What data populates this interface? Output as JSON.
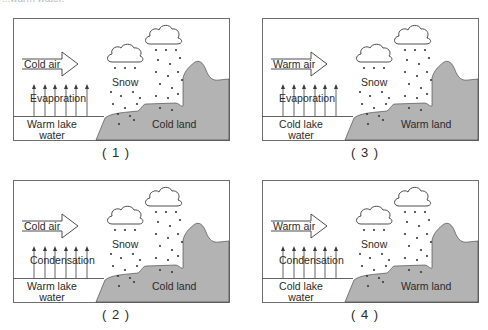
{
  "header": {
    "partial_text": "...warm water."
  },
  "colors": {
    "land": "#b3b3b3",
    "frame": "#6e6e6e",
    "line": "#3a3a3a",
    "text": "#2a2a2a"
  },
  "panels": [
    {
      "id": "1",
      "caption": "( 1 )",
      "air_label": "Cold air",
      "process_label": "Evaporation",
      "snow_label": "Snow",
      "water_label_line1": "Warm lake",
      "water_label_line2": "water",
      "land_label": "Cold land"
    },
    {
      "id": "2",
      "caption": "( 2 )",
      "air_label": "Cold air",
      "process_label": "Condensation",
      "snow_label": "Snow",
      "water_label_line1": "Warm lake",
      "water_label_line2": "water",
      "land_label": "Cold land"
    },
    {
      "id": "3",
      "caption": "( 3 )",
      "air_label": "Warm air",
      "process_label": "Evaporation",
      "snow_label": "Snow",
      "water_label_line1": "Cold lake",
      "water_label_line2": "water",
      "land_label": "Warm land"
    },
    {
      "id": "4",
      "caption": "( 4 )",
      "air_label": "Warm air",
      "process_label": "Condensation",
      "snow_label": "Snow",
      "water_label_line1": "Cold lake",
      "water_label_line2": "water",
      "land_label": "Warm land"
    }
  ]
}
